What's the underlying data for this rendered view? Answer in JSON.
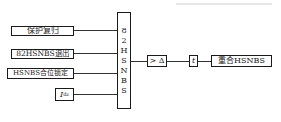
{
  "diagram": {
    "inputs": [
      {
        "label": "保护复归"
      },
      {
        "label": "82HSNBS退出"
      },
      {
        "label": "HSNBS合位锁定"
      },
      {
        "symbol": "I",
        "subscript": "dz"
      }
    ],
    "logic_block": {
      "chars": [
        "8",
        "2",
        "H",
        "S",
        "N",
        "B",
        "S"
      ]
    },
    "threshold_block": {
      "label": "> Δ"
    },
    "timer_block": {
      "label": "t"
    },
    "output": {
      "label": "重合HSNBS"
    }
  }
}
